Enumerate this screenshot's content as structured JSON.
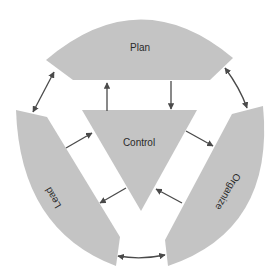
{
  "diagram": {
    "nodes": {
      "plan": {
        "label": "Plan"
      },
      "control": {
        "label": "Control"
      },
      "lead": {
        "label": "Lead"
      },
      "organize": {
        "label": "Organize"
      }
    },
    "colors": {
      "segment_fill": "#c4c4c4",
      "arrow": "#4a4a4a",
      "text": "#2a2a2a",
      "background": "#ffffff"
    },
    "edges": [
      {
        "from": "plan",
        "to": "lead",
        "type": "bidirectional"
      },
      {
        "from": "plan",
        "to": "organize",
        "type": "bidirectional"
      },
      {
        "from": "lead",
        "to": "organize",
        "type": "bidirectional"
      },
      {
        "from": "control",
        "to": "plan",
        "type": "directed"
      },
      {
        "from": "plan",
        "to": "control",
        "type": "directed"
      },
      {
        "from": "control",
        "to": "organize",
        "type": "directed"
      },
      {
        "from": "organize",
        "to": "control",
        "type": "directed"
      },
      {
        "from": "lead",
        "to": "control",
        "type": "directed"
      },
      {
        "from": "control",
        "to": "lead",
        "type": "directed"
      }
    ]
  }
}
